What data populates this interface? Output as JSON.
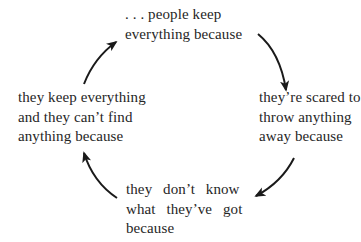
{
  "diagram": {
    "type": "cycle",
    "nodes": [
      {
        "id": "top",
        "lines": [
          ". . . people keep",
          "everything because"
        ]
      },
      {
        "id": "right",
        "lines": [
          "they’re scared to",
          "throw anything",
          "away because"
        ]
      },
      {
        "id": "bottom",
        "lines": [
          "they don’t know",
          "what they’ve got",
          "because"
        ]
      },
      {
        "id": "left",
        "lines": [
          "they keep everything",
          "and they can’t find",
          "anything because"
        ]
      }
    ],
    "edges": [
      {
        "from": "top",
        "to": "right",
        "icon": "curved-arrow-icon"
      },
      {
        "from": "right",
        "to": "bottom",
        "icon": "curved-arrow-icon"
      },
      {
        "from": "bottom",
        "to": "left",
        "icon": "curved-arrow-icon"
      },
      {
        "from": "left",
        "to": "top",
        "icon": "curved-arrow-icon"
      }
    ],
    "colors": {
      "text": "#262626",
      "arrow": "#1a1a1a",
      "background": "#ffffff"
    }
  }
}
